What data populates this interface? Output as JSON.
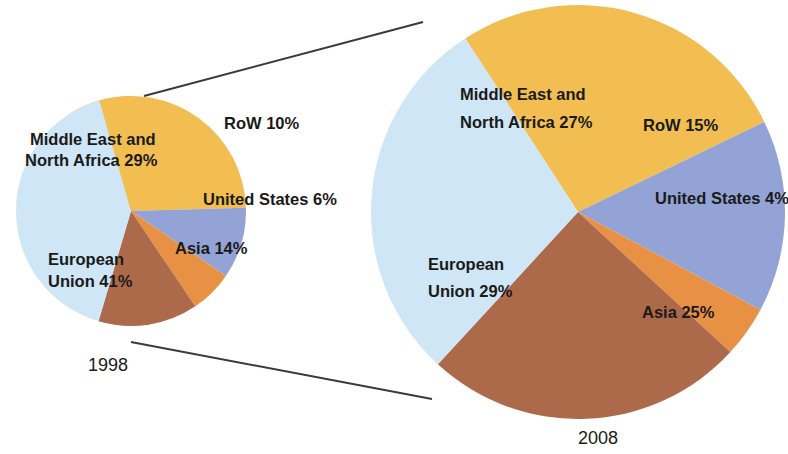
{
  "figure": {
    "background_color": "#ffffff",
    "title": "",
    "connector_color": "#3a3a3a"
  },
  "palette": {
    "middle_east_north_africa": "#F2BE52",
    "row": "#93A3D6",
    "united_states": "#E89145",
    "asia": "#AD6A4A",
    "european_union": "#CFE6F6",
    "text": "#1a1a1a"
  },
  "charts": {
    "left": {
      "year_label": "1998",
      "labels": {
        "mena": "Middle East and",
        "mena2": "North Africa 29%",
        "row": "RoW 10%",
        "us": "United States  6%",
        "asia": "Asia 14%",
        "eu": "European",
        "eu2": "Union 41%"
      }
    },
    "right": {
      "year_label": "2008",
      "labels": {
        "mena": "Middle East and",
        "mena2": "North Africa 27%",
        "row": "RoW 15%",
        "us": "United States 4%",
        "asia": "Asia 25%",
        "eu": "European",
        "eu2": "Union 29%"
      }
    }
  },
  "chart_data": [
    {
      "type": "pie",
      "title": "1998",
      "categories": [
        "Middle East and North Africa",
        "RoW",
        "United States",
        "Asia",
        "European Union"
      ],
      "values": [
        29,
        10,
        6,
        14,
        41
      ],
      "value_unit": "%",
      "colors": [
        "#F2BE52",
        "#93A3D6",
        "#E89145",
        "#AD6A4A",
        "#CFE6F6"
      ],
      "labels": [
        "Middle East and North Africa 29%",
        "RoW 10%",
        "United States  6%",
        "Asia 14%",
        "European Union 41%"
      ],
      "legend": "none",
      "xlabel": "",
      "ylabel": ""
    },
    {
      "type": "pie",
      "title": "2008",
      "categories": [
        "Middle East and North Africa",
        "RoW",
        "United States",
        "Asia",
        "European Union"
      ],
      "values": [
        27,
        15,
        4,
        25,
        29
      ],
      "value_unit": "%",
      "colors": [
        "#F2BE52",
        "#93A3D6",
        "#E89145",
        "#AD6A4A",
        "#CFE6F6"
      ],
      "labels": [
        "Middle East and North Africa 27%",
        "RoW 15%",
        "United States 4%",
        "Asia 25%",
        "European Union 29%"
      ],
      "legend": "none",
      "xlabel": "",
      "ylabel": ""
    }
  ]
}
